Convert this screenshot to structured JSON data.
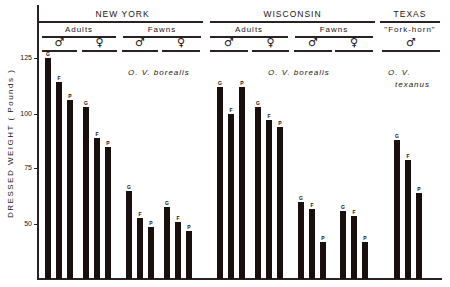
{
  "chart_data": {
    "type": "bar",
    "title": "",
    "ylabel": "DRESSED WEIGHT ( Pounds )",
    "xlabel": "",
    "ylim": [
      25,
      130
    ],
    "yticks": [
      50,
      75,
      100,
      125
    ],
    "grid": false,
    "bar_letter_legend": [
      "G",
      "F",
      "P"
    ],
    "groups": [
      {
        "region": "NEW YORK",
        "species": "O. V. borealis",
        "age": "Adults",
        "sex": "♂",
        "bars": [
          {
            "label": "G",
            "value": 125
          },
          {
            "label": "F",
            "value": 114
          },
          {
            "label": "P",
            "value": 106
          }
        ]
      },
      {
        "region": "NEW YORK",
        "species": "O. V. borealis",
        "age": "Adults",
        "sex": "♀",
        "bars": [
          {
            "label": "G",
            "value": 103
          },
          {
            "label": "F",
            "value": 89
          },
          {
            "label": "P",
            "value": 85
          }
        ]
      },
      {
        "region": "NEW YORK",
        "species": "O. V. borealis",
        "age": "Fawns",
        "sex": "♂",
        "bars": [
          {
            "label": "G",
            "value": 65
          },
          {
            "label": "F",
            "value": 53
          },
          {
            "label": "P",
            "value": 49
          }
        ]
      },
      {
        "region": "NEW YORK",
        "species": "O. V. borealis",
        "age": "Fawns",
        "sex": "♀",
        "bars": [
          {
            "label": "G",
            "value": 58
          },
          {
            "label": "F",
            "value": 51
          },
          {
            "label": "P",
            "value": 47
          }
        ]
      },
      {
        "region": "WISCONSIN",
        "species": "O. V. borealis",
        "age": "Adults",
        "sex": "♂",
        "bars": [
          {
            "label": "G",
            "value": 112
          },
          {
            "label": "F",
            "value": 100
          },
          {
            "label": "P",
            "value": 112
          }
        ]
      },
      {
        "region": "WISCONSIN",
        "species": "O. V. borealis",
        "age": "Adults",
        "sex": "♀",
        "bars": [
          {
            "label": "G",
            "value": 103
          },
          {
            "label": "F",
            "value": 97
          },
          {
            "label": "P",
            "value": 94
          }
        ]
      },
      {
        "region": "WISCONSIN",
        "species": "O. V. borealis",
        "age": "Fawns",
        "sex": "♂",
        "bars": [
          {
            "label": "G",
            "value": 60
          },
          {
            "label": "F",
            "value": 57
          },
          {
            "label": "P",
            "value": 42
          }
        ]
      },
      {
        "region": "WISCONSIN",
        "species": "O. V. borealis",
        "age": "Fawns",
        "sex": "♀",
        "bars": [
          {
            "label": "G",
            "value": 56
          },
          {
            "label": "F",
            "value": 54
          },
          {
            "label": "P",
            "value": 42
          }
        ]
      },
      {
        "region": "TEXAS",
        "species": "O. V. texanus",
        "age": "\"Fork-horn\"",
        "sex": "♂",
        "bars": [
          {
            "label": "G",
            "value": 88
          },
          {
            "label": "F",
            "value": 79
          },
          {
            "label": "P",
            "value": 64
          }
        ]
      }
    ]
  },
  "header": {
    "regions": [
      {
        "name": "NEW YORK"
      },
      {
        "name": "WISCONSIN"
      },
      {
        "name": "TEXAS"
      }
    ],
    "ages": [
      {
        "name": "Adults"
      },
      {
        "name": "Fawns"
      },
      {
        "name": "Adults"
      },
      {
        "name": "Fawns"
      },
      {
        "name": "\"Fork-horn\""
      }
    ],
    "sexes": [
      "♂",
      "♀",
      "♂",
      "♀",
      "♂",
      "♀",
      "♂",
      "♀",
      "♂"
    ]
  },
  "species_labels": {
    "ny": "O. V. borealis",
    "wi": "O. V. borealis",
    "tx_line1": "O. V.",
    "tx_line2": "texanus"
  },
  "axis": {
    "ylabel": "DRESSED WEIGHT ( Pounds )",
    "ticks": [
      "125",
      "100",
      "75",
      "50"
    ]
  }
}
